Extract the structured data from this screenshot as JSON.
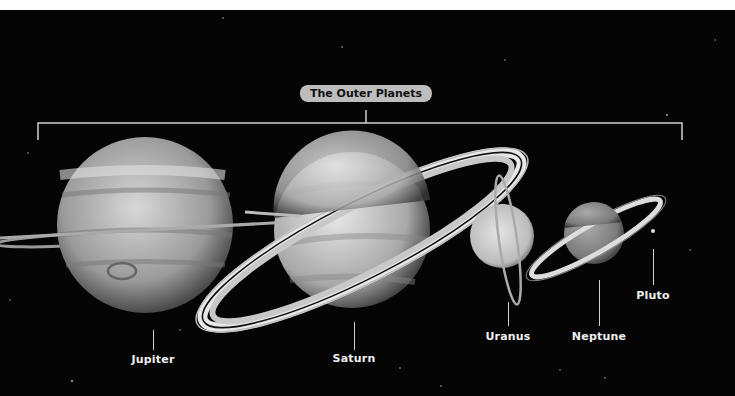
{
  "title": "The Outer Planets",
  "colors": {
    "background": "#050505",
    "label": "#f0f0f0",
    "title_pill": "#bdbdbd",
    "bracket": "#cfcfcf"
  },
  "planets": [
    {
      "name": "Jupiter",
      "label_x": 153,
      "label_y": 353
    },
    {
      "name": "Saturn",
      "label_x": 354,
      "label_y": 352
    },
    {
      "name": "Uranus",
      "label_x": 508,
      "label_y": 330
    },
    {
      "name": "Neptune",
      "label_x": 599,
      "label_y": 330
    },
    {
      "name": "Pluto",
      "label_x": 653,
      "label_y": 289
    }
  ]
}
